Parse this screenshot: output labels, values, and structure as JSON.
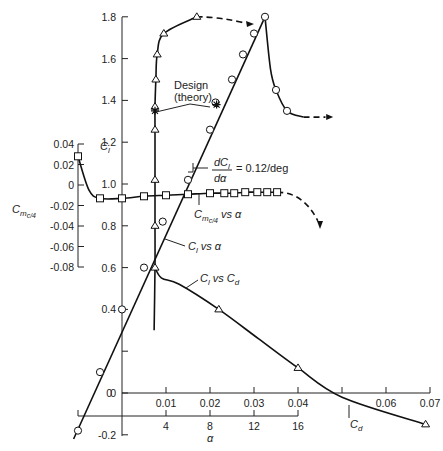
{
  "chart_data": {
    "type": "line",
    "title": "",
    "axes": {
      "cl": {
        "label": "C_l",
        "ticks": [
          "-0.2",
          "0",
          "0.4",
          "0.6",
          "0.8",
          "1.0",
          "1.2",
          "1.4",
          "1.6",
          "1.8"
        ],
        "range": [
          -0.2,
          1.8
        ]
      },
      "cm": {
        "label": "C_m,c/4",
        "ticks": [
          "0.04",
          "0.02",
          "0",
          "-0.02",
          "-0.04",
          "-0.06",
          "-0.08"
        ],
        "range": [
          -0.08,
          0.04
        ]
      },
      "cd": {
        "label": "C_d",
        "ticks": [
          "0.01",
          "0.02",
          "0.03",
          "0.04",
          "0.06",
          "0.07"
        ],
        "range": [
          0,
          0.07
        ]
      },
      "alpha": {
        "label": "α",
        "ticks": [
          "4",
          "8",
          "12",
          "16"
        ],
        "range": [
          -4,
          16
        ]
      }
    },
    "series": [
      {
        "name": "C_l vs α",
        "marker": "circle",
        "x": [
          -4,
          -2,
          0,
          2,
          3.7,
          6,
          8,
          8.5,
          10,
          11,
          12,
          13,
          14,
          15
        ],
        "y": [
          -0.18,
          0.1,
          0.4,
          0.6,
          0.82,
          1.02,
          1.26,
          1.39,
          1.5,
          1.62,
          1.72,
          1.8,
          1.45,
          1.35
        ]
      },
      {
        "name": "C_l vs C_d",
        "marker": "triangle",
        "x": [
          0.0075,
          0.0075,
          0.0075,
          0.0075,
          0.0075,
          0.0077,
          0.008,
          0.0095,
          0.017,
          0.022,
          0.04,
          0.069
        ],
        "y": [
          0.6,
          0.8,
          1.02,
          1.26,
          1.37,
          1.5,
          1.62,
          1.72,
          1.8,
          0.4,
          0.12,
          -0.15
        ]
      },
      {
        "name": "C_m,c/4 vs α",
        "marker": "square",
        "x": [
          -4,
          -2,
          0,
          2,
          4,
          6,
          8,
          9.3,
          10.2,
          11.2,
          12.3,
          13.2,
          14.1
        ],
        "y": [
          0.028,
          -0.013,
          -0.013,
          -0.011,
          -0.01,
          -0.009,
          -0.008,
          -0.008,
          -0.008,
          -0.007,
          -0.007,
          -0.007,
          -0.007
        ]
      }
    ],
    "annotations": [
      "Design (theory)",
      "dC_l/dα = 0.12/deg",
      "C_m,c/4 vs α",
      "C_l vs α",
      "C_l vs C_d",
      "C_d"
    ]
  },
  "labels": {
    "design": "Design",
    "theory": "(theory)",
    "slope_num": "dC",
    "slope_den": "dα",
    "slope_val": "= 0.12/deg",
    "cm_vs": "vs α",
    "cl_vs_alpha": "vs α",
    "cl_vs_cd": "vs",
    "cd": "C",
    "alpha": "α"
  }
}
